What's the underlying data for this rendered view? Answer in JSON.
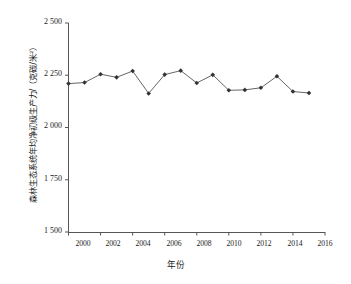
{
  "chart_data": {
    "type": "line",
    "title": "",
    "subtitle": "",
    "xlabel": "年份",
    "ylabel": "森林生态系统年均净初级生产力/（克碳/米²）",
    "x": [
      2000,
      2001,
      2002,
      2003,
      2004,
      2005,
      2006,
      2007,
      2008,
      2009,
      2010,
      2011,
      2012,
      2013,
      2014,
      2015
    ],
    "values": [
      2210,
      2215,
      2255,
      2240,
      2270,
      2163,
      2253,
      2272,
      2213,
      2252,
      2178,
      2180,
      2190,
      2245,
      2172,
      2165
    ],
    "series": [
      {
        "name": "森林生态系统年均净初级生产力",
        "values": [
          2210,
          2215,
          2255,
          2240,
          2270,
          2163,
          2253,
          2272,
          2213,
          2252,
          2178,
          2180,
          2190,
          2245,
          2172,
          2165
        ]
      }
    ],
    "xlim": [
      2000,
      2016
    ],
    "ylim": [
      1500,
      2500
    ],
    "x_ticks": [
      2000,
      2002,
      2004,
      2006,
      2008,
      2010,
      2012,
      2014,
      2016
    ],
    "x_tick_labels": [
      "2000",
      "2002",
      "2004",
      "2006",
      "2008",
      "2010",
      "2012",
      "2014",
      "2016"
    ],
    "y_ticks": [
      1500,
      1750,
      2000,
      2250,
      2500
    ],
    "y_tick_labels": [
      "1 500",
      "1 750",
      "2 000",
      "2 250",
      "2 500"
    ],
    "grid": false,
    "legend": null,
    "legend_position": "none",
    "marker": "diamond",
    "line_color": "#555555",
    "marker_color": "#333333",
    "axis_color": "#555555"
  }
}
